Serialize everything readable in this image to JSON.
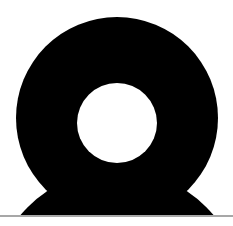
{
  "canvas": {
    "width": 233,
    "height": 226,
    "background": "#ffffff"
  },
  "shape": {
    "description": "black ring (donut) resting on a dome, above a horizontal baseline",
    "fill": "#000000",
    "hole_fill": "#ffffff",
    "outer_circle": {
      "cx": 117,
      "cy": 118,
      "r": 101
    },
    "inner_hole": {
      "cx": 117,
      "cy": 123,
      "r": 40
    },
    "base_dome": {
      "cx": 117,
      "cy": 296,
      "r": 126
    },
    "clip_bottom_y": 215
  },
  "baseline": {
    "y": 216,
    "color": "#8a8a8a",
    "thickness": 1.5
  }
}
